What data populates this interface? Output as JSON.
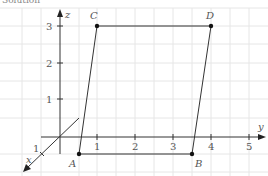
{
  "title_cut": "Solution",
  "axes": {
    "z_label": "z",
    "y_label": "y",
    "x_label": "x",
    "x_tick": "1",
    "y_ticks": [
      "1",
      "2",
      "3",
      "4",
      "5"
    ],
    "z_ticks": [
      "1",
      "2",
      "3"
    ]
  },
  "points": {
    "A": "A",
    "B": "B",
    "C": "C",
    "D": "D"
  },
  "colors": {
    "grid": "#e6e6e6",
    "axis": "#333333",
    "shape": "#333333",
    "label": "#555555"
  }
}
